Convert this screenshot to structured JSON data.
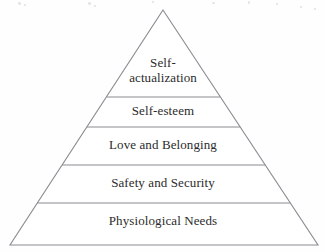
{
  "figure": {
    "type": "pyramid-hierarchy",
    "background_color": "#fefefe",
    "stroke_color": "#8b8b92",
    "text_color": "#2b2b2b",
    "apex": {
      "x": 163,
      "y": 10
    },
    "base_left": {
      "x": 10,
      "y": 245
    },
    "base_right": {
      "x": 318,
      "y": 245
    },
    "divider_y": [
      97,
      127,
      165,
      203
    ],
    "tiers": [
      {
        "index": 1,
        "level": "top",
        "label": "Self-\nactualization",
        "label_plain": "Self-actualization",
        "font_size_px": 13,
        "lines": 2,
        "text_center_x": 163,
        "text_top_y": 56
      },
      {
        "index": 2,
        "level": "second",
        "label": "Self-esteem",
        "label_plain": "Self-esteem",
        "font_size_px": 13,
        "lines": 1,
        "text_center_x": 163,
        "text_top_y": 104
      },
      {
        "index": 3,
        "level": "middle",
        "label": "Love and Belonging",
        "label_plain": "Love and Belonging",
        "font_size_px": 13,
        "lines": 1,
        "text_center_x": 163,
        "text_top_y": 138
      },
      {
        "index": 4,
        "level": "fourth",
        "label": "Safety and Security",
        "label_plain": "Safety and Security",
        "font_size_px": 13,
        "lines": 1,
        "text_center_x": 163,
        "text_top_y": 176
      },
      {
        "index": 5,
        "level": "base",
        "label": "Physiological Needs",
        "label_plain": "Physiological Needs",
        "font_size_px": 13,
        "lines": 1,
        "text_center_x": 163,
        "text_top_y": 214
      }
    ],
    "artifacts": {
      "description": "faint scanner specks along the top edge",
      "specks": [
        {
          "x": 18,
          "y": 2,
          "w": 3,
          "h": 3
        },
        {
          "x": 24,
          "y": 4,
          "w": 2,
          "h": 2
        },
        {
          "x": 88,
          "y": 2,
          "w": 3,
          "h": 3
        },
        {
          "x": 94,
          "y": 5,
          "w": 2,
          "h": 2
        },
        {
          "x": 152,
          "y": 1,
          "w": 2,
          "h": 2
        },
        {
          "x": 212,
          "y": 2,
          "w": 3,
          "h": 2
        },
        {
          "x": 248,
          "y": 1,
          "w": 2,
          "h": 3
        },
        {
          "x": 276,
          "y": 3,
          "w": 2,
          "h": 2
        },
        {
          "x": 300,
          "y": 6,
          "w": 2,
          "h": 2
        },
        {
          "x": 314,
          "y": 8,
          "w": 2,
          "h": 2
        }
      ]
    }
  }
}
